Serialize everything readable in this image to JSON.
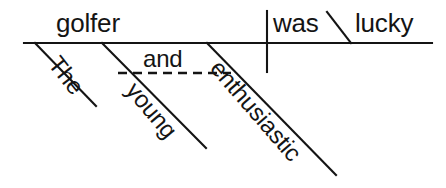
{
  "diagram": {
    "type": "reed-kellogg-sentence-diagram",
    "sentence": "The young and enthusiastic golfer was lucky.",
    "colors": {
      "ink": "#141414",
      "background": "#ffffff"
    },
    "baseline": {
      "label": "main-horizontal-baseline",
      "x1": 24,
      "y1": 43,
      "x2": 432,
      "y2": 43
    },
    "subject_predicate_divider": {
      "label": "vertical-subject-predicate-divider",
      "x1": 267,
      "y1": 11,
      "x2": 267,
      "y2": 72
    },
    "complement_divider": {
      "label": "slanted-subject-complement-line",
      "x1": 327,
      "y1": 12,
      "x2": 351,
      "y2": 43
    },
    "conjunction_line": {
      "label": "dashed-conjunction-line",
      "x1": 118,
      "y1": 73,
      "x2": 231,
      "y2": 73,
      "style": "dashed"
    },
    "modifier_lines": [
      {
        "label": "modifier-line-the",
        "x1": 35,
        "y1": 43,
        "x2": 96,
        "y2": 106
      },
      {
        "label": "modifier-line-young",
        "x1": 102,
        "y1": 43,
        "x2": 206,
        "y2": 148
      },
      {
        "label": "modifier-line-enthusiastic",
        "x1": 207,
        "y1": 43,
        "x2": 336,
        "y2": 175
      }
    ],
    "words": {
      "subject": "golfer",
      "verb": "was",
      "complement": "lucky",
      "conjunction": "and",
      "article": "The",
      "adjective_one": "young",
      "adjective_two": "enthusiastic"
    }
  }
}
